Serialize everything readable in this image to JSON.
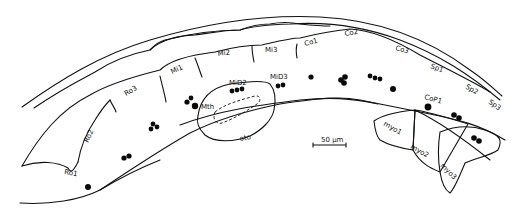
{
  "figure": {
    "labels": {
      "ro1": "Ro1",
      "ro2": "Ro2",
      "ro3": "Ro3",
      "mi1": "Mi1",
      "mi2": "Mi2",
      "mi3": "Mi3",
      "co1": "Co1",
      "co2": "Co2",
      "co3": "Co3",
      "sp1": "Sp1",
      "sp2": "Sp2",
      "sp3": "Sp3",
      "mid2": "MiD2",
      "mid3": "MiD3",
      "mth": "Mth",
      "oto": "oto",
      "cop1": "CoP1",
      "myo1": "myo1",
      "myo2": "myo2",
      "myo3": "myo3"
    },
    "scale_bar": {
      "label": "50 µm"
    },
    "colors": {
      "line": "#111111",
      "background": "#ffffff"
    }
  }
}
